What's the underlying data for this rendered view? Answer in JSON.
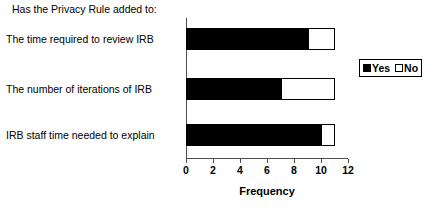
{
  "chart_data": {
    "type": "bar",
    "orientation": "horizontal",
    "stacked": true,
    "title": "Has the Privacy Rule added to:",
    "xlabel": "Frequency",
    "ylabel": "",
    "xlim": [
      0,
      12
    ],
    "xticks": [
      0,
      2,
      4,
      6,
      8,
      10,
      12
    ],
    "xtick_labels": [
      "0",
      "2",
      "4",
      "6",
      "8",
      "10",
      "12"
    ],
    "grid": false,
    "legend_position": "right",
    "categories": [
      "The time required to review IRB",
      "The number of iterations of IRB",
      "IRB staff time needed to explain"
    ],
    "series": [
      {
        "name": "Yes",
        "color": "#000000",
        "values": [
          9,
          7,
          10
        ]
      },
      {
        "name": "No",
        "color": "#ffffff",
        "values": [
          2,
          4,
          1
        ]
      }
    ],
    "totals": [
      11,
      11,
      11
    ]
  },
  "legend": {
    "yes_label": "Yes",
    "no_label": "No"
  }
}
